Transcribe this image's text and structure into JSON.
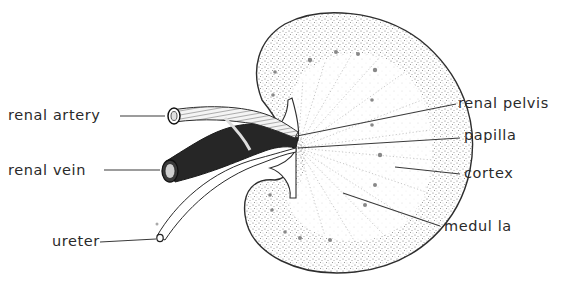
{
  "diagram": {
    "style": "stippled pen-and-ink line drawing",
    "colors": {
      "background": "#ffffff",
      "ink": "#2a2a2a",
      "vein_fill": "#262626",
      "stipple": "#7a7a7a"
    },
    "labels": [
      {
        "id": "renal-artery",
        "text": "renal  artery",
        "x": 8,
        "y": 108
      },
      {
        "id": "renal-vein",
        "text": "renal  vein",
        "x": 8,
        "y": 163
      },
      {
        "id": "ureter",
        "text": "ureter",
        "x": 52,
        "y": 234
      },
      {
        "id": "renal-pelvis",
        "text": "renal  pelvis",
        "x": 458,
        "y": 96
      },
      {
        "id": "papilla",
        "text": "papilla",
        "x": 464,
        "y": 126
      },
      {
        "id": "cortex",
        "text": "cortex",
        "x": 464,
        "y": 165
      },
      {
        "id": "medulla",
        "text": "medul la",
        "x": 444,
        "y": 219
      }
    ]
  }
}
